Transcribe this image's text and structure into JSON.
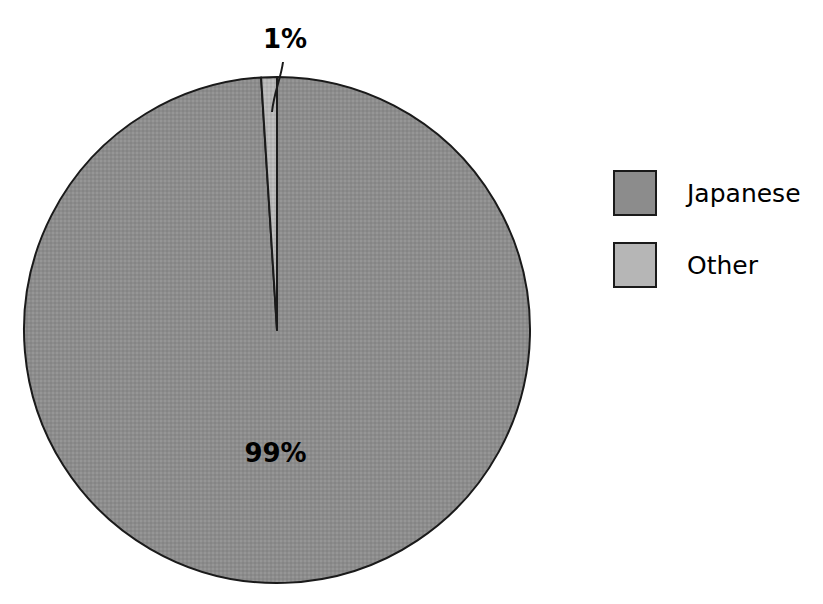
{
  "chart_data": {
    "type": "pie",
    "title": "",
    "labels": [
      "Japanese",
      "Other"
    ],
    "values": [
      99,
      1
    ],
    "value_labels": [
      "99%",
      "1%"
    ],
    "colors": [
      "#8c8c8c",
      "#b6b6b6"
    ],
    "legend_position": "right",
    "grid": false,
    "xlabel": "",
    "ylabel": "",
    "start_angle_deg": 0,
    "direction": "clockwise",
    "slices": [
      {
        "name": "Japanese",
        "value": 99,
        "value_label": "99%",
        "color": "#8c8c8c",
        "label_placement": "inside"
      },
      {
        "name": "Other",
        "value": 1,
        "value_label": "1%",
        "color": "#b6b6b6",
        "label_placement": "outside-with-leader-line"
      }
    ]
  },
  "geometry": {
    "center_x": 277,
    "center_y": 330,
    "radius": 253,
    "outline_color": "#1a1a1a",
    "outline_width": 2,
    "leader_line_color": "#1a1a1a"
  },
  "labels": {
    "other_pct": "1%",
    "japanese_pct": "99%"
  },
  "legend": {
    "items": [
      {
        "label": "Japanese",
        "color": "#8c8c8c"
      },
      {
        "label": "Other",
        "color": "#b6b6b6"
      }
    ]
  },
  "colors": {
    "background": "#ffffff",
    "text": "#000000",
    "japanese": "#8c8c8c",
    "other": "#b6b6b6",
    "outline": "#1a1a1a"
  }
}
